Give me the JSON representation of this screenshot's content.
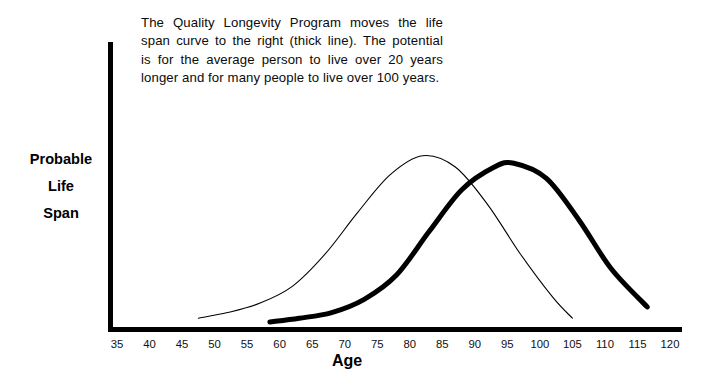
{
  "caption": {
    "lines": [
      "The Quality Longevity Program moves the life",
      "span curve to the right (thick line).  The potential",
      "is for the average person to live over 20 years",
      "longer and for many people to live over 100 years."
    ],
    "words": [
      [
        "The",
        "Quality",
        "Longevity",
        "Program",
        "moves",
        "the",
        "life"
      ],
      [
        "span",
        "curve",
        "to",
        "the",
        "right",
        "(thick",
        "line).",
        "",
        "The",
        "potential"
      ],
      [
        "is",
        "for",
        "the",
        "average",
        "person",
        "to",
        "live",
        "over",
        "20",
        "years"
      ],
      [
        "longer and for many people to live over 100 years."
      ]
    ]
  },
  "axes": {
    "y_title_lines": [
      "Probable",
      "Life",
      "Span"
    ],
    "y_title": "Probable Life Span",
    "x_title": "Age",
    "axis_color": "#000000"
  },
  "chart_data": {
    "type": "line",
    "title": "",
    "subtitle": "The Quality Longevity Program moves the life span curve to the right (thick line).  The potential is for the average person to live over 20 years longer and for many people to live over 100 years.",
    "xlabel": "Age",
    "ylabel": "Probable Life Span",
    "xlim": [
      35,
      120
    ],
    "ylim": [
      0,
      1
    ],
    "grid": false,
    "legend": "none",
    "xticks": [
      35,
      40,
      45,
      50,
      55,
      60,
      65,
      70,
      75,
      80,
      85,
      90,
      95,
      100,
      105,
      110,
      115,
      120
    ],
    "ytick_labels": [],
    "annotations": [
      "thin line = current life span curve",
      "thick line = curve shifted right by Quality Longevity Program"
    ],
    "series": [
      {
        "name": "Current life span curve",
        "style": "thin",
        "stroke": "#000000",
        "stroke_width": 1.1,
        "peak_x": 82,
        "x": [
          47.5,
          52,
          57,
          62,
          67,
          72,
          77,
          82,
          87,
          92,
          97,
          102,
          105
        ],
        "y": [
          0.02,
          0.05,
          0.1,
          0.19,
          0.36,
          0.58,
          0.78,
          0.88,
          0.82,
          0.62,
          0.36,
          0.13,
          0.02
        ]
      },
      {
        "name": "Quality Longevity Program curve",
        "style": "thick",
        "stroke": "#000000",
        "stroke_width": 5,
        "peak_x": 96,
        "x": [
          58.5,
          63,
          68,
          73,
          78,
          83,
          88,
          93,
          96,
          101,
          106,
          111,
          116.5
        ],
        "y": [
          0.0,
          0.02,
          0.05,
          0.12,
          0.25,
          0.48,
          0.7,
          0.82,
          0.84,
          0.76,
          0.54,
          0.28,
          0.08
        ]
      }
    ]
  }
}
